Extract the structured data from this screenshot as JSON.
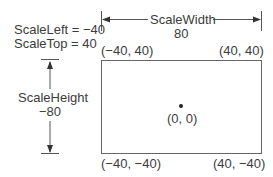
{
  "labels": {
    "scale_left": "ScaleLeft = −40",
    "scale_top": "ScaleTop = 40",
    "scale_width": "ScaleWidth",
    "scale_width_value": "80",
    "scale_height": "ScaleHeight",
    "scale_height_value": "−80"
  },
  "corners": {
    "top_left": "(−40, 40)",
    "top_right": "(40, 40)",
    "bottom_left": "(−40, −40)",
    "bottom_right": "(40, −40)"
  },
  "center": {
    "label": "(0, 0)"
  },
  "colors": {
    "line": "#555555",
    "text": "#3c3c3c",
    "background": "#ffffff"
  }
}
